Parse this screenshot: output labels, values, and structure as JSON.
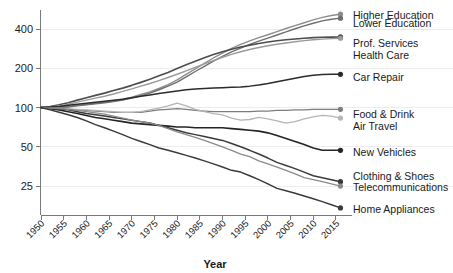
{
  "chart_data": {
    "type": "line",
    "title": "",
    "subtitle": "",
    "xlabel": "Year",
    "ylabel": "",
    "yscale": "log",
    "ylim": [
      15,
      560
    ],
    "xlim": [
      1950,
      2017
    ],
    "grid": true,
    "gridlines_at": [
      25,
      50,
      100,
      200,
      400
    ],
    "ytick_labels": [
      "400",
      "200",
      "100",
      "50",
      "25"
    ],
    "ytick_values": [
      400,
      200,
      100,
      50,
      25
    ],
    "xtick_labels": [
      "1950",
      "1955",
      "1960",
      "1965",
      "1970",
      "1975",
      "1980",
      "1985",
      "1990",
      "1995",
      "2000",
      "2005",
      "2010",
      "2015"
    ],
    "xtick_values": [
      1950,
      1955,
      1960,
      1965,
      1970,
      1975,
      1980,
      1985,
      1990,
      1995,
      2000,
      2005,
      2010,
      2015
    ],
    "xtick_rotation_deg": 45,
    "legend_position": "right-end-labels",
    "x": [
      1950,
      1952,
      1954,
      1956,
      1958,
      1960,
      1962,
      1964,
      1966,
      1968,
      1970,
      1972,
      1974,
      1976,
      1978,
      1980,
      1982,
      1984,
      1986,
      1988,
      1990,
      1992,
      1994,
      1996,
      1998,
      2000,
      2002,
      2004,
      2006,
      2008,
      2010,
      2012,
      2014,
      2016
    ],
    "series": [
      {
        "name": "Higher Education",
        "label": "Higher Education",
        "color": "#8e8e8e",
        "width": 1.4,
        "end_value": 520,
        "label_y": 16,
        "values": [
          100,
          100,
          101,
          102,
          104,
          106,
          108,
          110,
          113,
          116,
          120,
          126,
          132,
          140,
          150,
          163,
          180,
          198,
          218,
          240,
          262,
          284,
          305,
          325,
          344,
          362,
          382,
          404,
          425,
          447,
          470,
          492,
          508,
          520
        ]
      },
      {
        "name": "Lower Education",
        "label": "Lower Education",
        "color": "#6f6f6f",
        "width": 1.4,
        "end_value": 485,
        "label_y": 24,
        "values": [
          100,
          100,
          100,
          101,
          103,
          105,
          107,
          109,
          111,
          114,
          118,
          123,
          129,
          137,
          146,
          157,
          172,
          189,
          207,
          227,
          247,
          267,
          286,
          305,
          323,
          341,
          360,
          381,
          402,
          423,
          443,
          462,
          476,
          485
        ]
      },
      {
        "name": "Prof. Services",
        "label": "Prof. Services",
        "color": "#4d4d4d",
        "width": 1.6,
        "end_value": 348,
        "label_y": 44,
        "values": [
          100,
          102,
          105,
          109,
          114,
          119,
          124,
          129,
          135,
          141,
          148,
          156,
          165,
          175,
          186,
          199,
          213,
          227,
          241,
          255,
          268,
          280,
          291,
          301,
          310,
          318,
          325,
          331,
          336,
          340,
          344,
          346,
          347,
          348
        ]
      },
      {
        "name": "Health Care",
        "label": "Health Care",
        "color": "#9a9a9a",
        "width": 1.4,
        "end_value": 340,
        "label_y": 56,
        "values": [
          100,
          101,
          103,
          106,
          110,
          114,
          118,
          122,
          127,
          133,
          139,
          146,
          153,
          161,
          170,
          180,
          191,
          203,
          216,
          229,
          243,
          256,
          268,
          279,
          289,
          298,
          306,
          313,
          320,
          326,
          331,
          335,
          338,
          340
        ]
      },
      {
        "name": "Car Repair",
        "label": "Car Repair",
        "color": "#2b2b2b",
        "width": 1.5,
        "end_value": 180,
        "label_y": 78,
        "values": [
          100,
          101,
          102,
          104,
          106,
          108,
          110,
          112,
          114,
          116,
          119,
          122,
          125,
          128,
          131,
          134,
          137,
          139,
          140,
          141,
          142,
          143,
          144,
          146,
          149,
          153,
          158,
          163,
          168,
          173,
          177,
          179,
          180,
          180
        ]
      },
      {
        "name": "Food & Drink",
        "label": "Food & Drink",
        "color": "#7d7d7d",
        "width": 1.3,
        "end_value": 97,
        "label_y": 115,
        "values": [
          100,
          99,
          98,
          97,
          96,
          95,
          94,
          93,
          92,
          92,
          92,
          92,
          94,
          96,
          97,
          98,
          97,
          95,
          94,
          93,
          93,
          93,
          93,
          93,
          94,
          94,
          95,
          95,
          96,
          96,
          97,
          97,
          97,
          97
        ]
      },
      {
        "name": "Air Travel",
        "label": "Air Travel",
        "color": "#b5b5b5",
        "width": 1.3,
        "end_value": 83,
        "label_y": 127,
        "values": [
          100,
          99,
          99,
          98,
          97,
          96,
          95,
          94,
          93,
          92,
          92,
          93,
          96,
          99,
          103,
          108,
          103,
          97,
          93,
          90,
          88,
          83,
          80,
          81,
          84,
          82,
          79,
          76,
          78,
          82,
          85,
          87,
          86,
          83
        ]
      },
      {
        "name": "New Vehicles",
        "label": "New Vehicles",
        "color": "#242424",
        "width": 1.6,
        "end_value": 47,
        "label_y": 153,
        "values": [
          100,
          98,
          96,
          93,
          90,
          87,
          84,
          82,
          80,
          78,
          76,
          75,
          74,
          73,
          72,
          71,
          71,
          70,
          70,
          70,
          70,
          69,
          68,
          67,
          66,
          64,
          61,
          58,
          55,
          52,
          49,
          47,
          47,
          47
        ]
      },
      {
        "name": "Clothing & Shoes",
        "label": "Clothing & Shoes",
        "color": "#3a3a3a",
        "width": 1.5,
        "end_value": 27,
        "label_y": 177,
        "values": [
          100,
          99,
          98,
          96,
          93,
          90,
          88,
          86,
          84,
          82,
          80,
          78,
          76,
          73,
          70,
          67,
          64,
          62,
          60,
          58,
          56,
          53,
          50,
          47,
          44,
          41,
          38,
          36,
          34,
          32,
          30,
          29,
          28,
          27
        ]
      },
      {
        "name": "Telecommunications",
        "label": "Telecommunications",
        "color": "#8a8a8a",
        "width": 1.3,
        "end_value": 25,
        "label_y": 188,
        "values": [
          100,
          99,
          98,
          97,
          95,
          93,
          91,
          89,
          86,
          83,
          80,
          78,
          76,
          73,
          69,
          65,
          62,
          59,
          56,
          53,
          50,
          47,
          44,
          42,
          39,
          37,
          35,
          33,
          31,
          29,
          28,
          27,
          26,
          25
        ]
      },
      {
        "name": "Home Appliances",
        "label": "Home Appliances",
        "color": "#3a3a3a",
        "width": 1.5,
        "end_value": 17,
        "label_y": 210,
        "values": [
          100,
          96,
          92,
          88,
          84,
          79,
          74,
          70,
          66,
          62,
          58,
          55,
          52,
          49,
          47,
          45,
          43,
          41,
          39,
          37,
          35,
          33,
          32,
          30,
          28,
          26,
          24,
          23,
          22,
          21,
          20,
          19,
          18,
          17
        ]
      }
    ]
  },
  "axes": {
    "x_axis_title": "Year"
  }
}
